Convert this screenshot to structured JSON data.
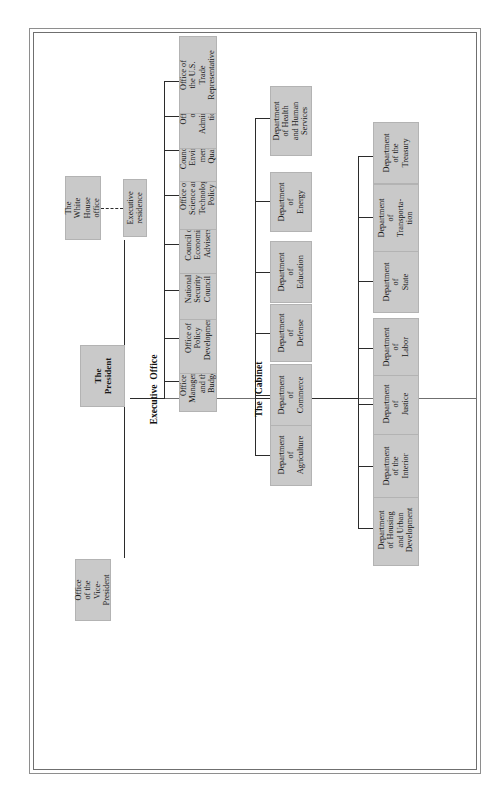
{
  "figure": {
    "label": "Figure 10.4.",
    "title": "Organization of the Presidency"
  },
  "sections": {
    "executive_office": "Executive  Office",
    "cabinet": "The   Cabinet"
  },
  "nodes": {
    "president": "The\nPresident",
    "vice_president": "Office\nof the\nVice-\nPresident",
    "white_house_office": "The\nWhite\nHouse\noffice",
    "executive_residence": "Executive\nresidence"
  },
  "executive_office_agencies": [
    "Office of\nManagement\nand the\nBudget",
    "Office of\nPolicy\nDevelopment",
    "National\nSecurity\nCouncil",
    "Council of\nEconomic\nAdvisers",
    "Office of\nScience and\nTechnology\nPolicy",
    "Council on\nEnviron-\nmental\nQuality",
    "Office\nof\nAdministra-\ntion",
    "Office of\nthe U.S.\nTrade\nRepresentative"
  ],
  "cabinet_departments_inner": [
    "Department\nof\nAgriculture",
    "Department\nof\nCommerce",
    "Department\nof\nDefense",
    "Department\nof\nEducation",
    "Department\nof\nEnergy",
    "Department\nof Health\nand Human\nServices"
  ],
  "cabinet_departments_outer": [
    "Department\nof Housing\nand Urban\nDevelopment",
    "Department\nof the\nInterior",
    "Department\nof\nJustice",
    "Department\nof\nLabor",
    "Department\nof\nState",
    "Department\nof\nTransporta-\ntion",
    "Department\nof the\nTreasury"
  ],
  "colors": {
    "box_fill": "#c9c9c9",
    "line": "#2b2b2b",
    "frame": "#8e8e8e"
  }
}
